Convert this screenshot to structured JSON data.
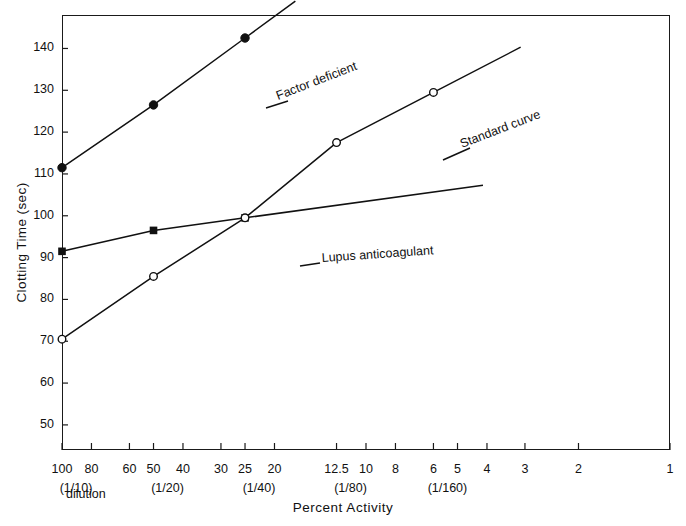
{
  "chart_data": {
    "type": "line",
    "title": "",
    "xlabel": "Percent Activity",
    "ylabel": "Clotting Time (sec)",
    "xscale": "log-reversed",
    "xlim": [
      100,
      1
    ],
    "ylim": [
      44,
      148
    ],
    "grid": false,
    "legend_position": "inline-annotations",
    "yticks": [
      50,
      60,
      70,
      80,
      90,
      100,
      110,
      120,
      130,
      140
    ],
    "xticks": [
      100,
      80,
      60,
      50,
      40,
      30,
      25,
      20,
      12.5,
      10,
      8,
      6,
      5,
      4,
      3,
      2,
      1
    ],
    "xtick_labels": [
      "100",
      "80",
      "60",
      "50",
      "40",
      "30",
      "25",
      "20",
      "12.5",
      "10",
      "8",
      "6",
      "5",
      "4",
      "3",
      "2",
      "1"
    ],
    "dilution_labels": [
      {
        "x": 100,
        "text": "(1/10)"
      },
      {
        "x": 50,
        "text": "(1/20)"
      },
      {
        "x": 25,
        "text": "(1/40)"
      },
      {
        "x": 12.5,
        "text": "(1/80)"
      },
      {
        "x": 6,
        "text": "(1/160)"
      }
    ],
    "dilution_word": "dilution",
    "series": [
      {
        "name": "Factor deficient",
        "marker": "filled-circle",
        "label": "Factor deficient",
        "points": [
          {
            "x": 100,
            "y": 111.5
          },
          {
            "x": 50,
            "y": 126.5
          },
          {
            "x": 25,
            "y": 142.5
          }
        ]
      },
      {
        "name": "Lupus anticoagulant",
        "marker": "filled-square",
        "label": "Lupus anticoagulant",
        "points": [
          {
            "x": 100,
            "y": 91.5
          },
          {
            "x": 50,
            "y": 96.5
          },
          {
            "x": 25,
            "y": 99.5
          }
        ]
      },
      {
        "name": "Standard curve",
        "marker": "open-circle",
        "label": "Standard curve",
        "points": [
          {
            "x": 100,
            "y": 70.5
          },
          {
            "x": 50,
            "y": 85.5
          },
          {
            "x": 25,
            "y": 99.5
          },
          {
            "x": 12.5,
            "y": 117.5
          },
          {
            "x": 6,
            "y": 129.5
          }
        ]
      }
    ],
    "annotations": [
      {
        "name": "factor-deficient-label",
        "text": "Factor deficient",
        "x_px": 278,
        "y_px": 100,
        "rotation": -21
      },
      {
        "name": "standard-curve-label",
        "text": "Standard curve",
        "x_px": 462,
        "y_px": 148,
        "rotation": -21
      },
      {
        "name": "lupus-anticoagulant-label",
        "text": "Lupus anticoagulant",
        "x_px": 322,
        "y_px": 262,
        "rotation": -4
      }
    ]
  }
}
